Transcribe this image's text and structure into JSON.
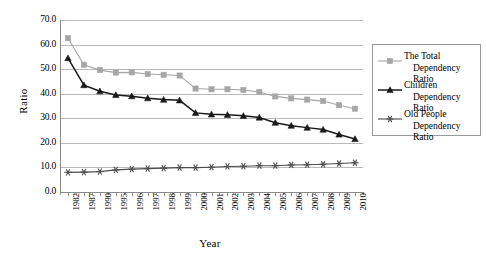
{
  "chart_data": {
    "type": "line",
    "title": "",
    "xlabel": "Year",
    "ylabel": "Ratio",
    "ylim": [
      0,
      70
    ],
    "ytick_step": 10,
    "ytick_labels": [
      "70.0",
      "60.0",
      "50.0",
      "40.0",
      "30.0",
      "20.0",
      "10.0",
      "0.0"
    ],
    "grid": true,
    "legend_position": "right",
    "categories": [
      "1982",
      "1987",
      "1990",
      "1995",
      "1996",
      "1997",
      "1998",
      "1999",
      "2000",
      "2001",
      "2002",
      "2003",
      "2004",
      "2005",
      "2006",
      "2007",
      "2008",
      "2009",
      "2010"
    ],
    "series": [
      {
        "name": "The Total Dependency Ratio",
        "marker": "square",
        "color": "#a6a6a6",
        "values": [
          62.6,
          51.8,
          49.6,
          48.6,
          48.7,
          48.0,
          47.7,
          47.4,
          42.1,
          41.8,
          41.8,
          41.5,
          40.7,
          38.9,
          38.1,
          37.6,
          37.0,
          35.3,
          33.9
        ]
      },
      {
        "name": "Children Dependency Ratio",
        "marker": "triangle",
        "color": "#1a1a1a",
        "values": [
          54.5,
          43.5,
          41.0,
          39.5,
          39.0,
          38.2,
          37.6,
          37.3,
          32.2,
          31.6,
          31.4,
          31.0,
          30.3,
          28.2,
          27.0,
          26.2,
          25.4,
          23.4,
          21.6
        ]
      },
      {
        "name": "Old People Dependency Ratio",
        "marker": "asterisk",
        "color": "#4d4d4d",
        "values": [
          8.0,
          8.1,
          8.3,
          9.0,
          9.3,
          9.5,
          9.7,
          9.9,
          9.9,
          10.1,
          10.4,
          10.5,
          10.7,
          10.7,
          11.0,
          11.1,
          11.3,
          11.6,
          11.9
        ]
      }
    ]
  },
  "legend": {
    "items": [
      {
        "line1": "The Total",
        "line2": "Dependency Ratio"
      },
      {
        "line1": "Children",
        "line2": "Dependency Ratio"
      },
      {
        "line1": "Old People",
        "line2": "Dependency Ratio"
      }
    ]
  }
}
